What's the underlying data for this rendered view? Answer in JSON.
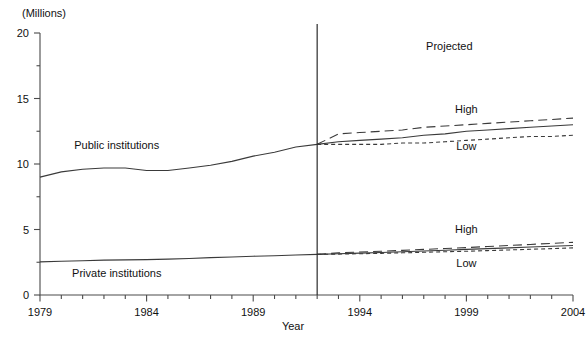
{
  "chart_data": {
    "type": "line",
    "title": "",
    "subtitle": "",
    "unit_label": "(Millions)",
    "xlabel": "Year",
    "ylabel": "",
    "xlim": [
      1979,
      2004
    ],
    "ylim": [
      0,
      20
    ],
    "yticks": [
      0,
      5,
      10,
      15,
      20
    ],
    "ytick_labels": [
      "0",
      "5",
      "10",
      "15",
      "20"
    ],
    "yminor_step": 2.5,
    "xticks": [
      1979,
      1984,
      1989,
      1994,
      1999,
      2004
    ],
    "xtick_labels": [
      "1979",
      "1984",
      "1989",
      "1994",
      "1999",
      "2004"
    ],
    "xminor_step": 1,
    "grid": false,
    "legend": "none",
    "projection_divider_year": 1992,
    "annotations": [
      {
        "name": "projected-label",
        "text": "Projected",
        "x": 1998.2,
        "y": 18.9
      },
      {
        "name": "public-series-label",
        "text": "Public institutions",
        "x": 1982.6,
        "y": 11.4
      },
      {
        "name": "private-series-label",
        "text": "Private institutions",
        "x": 1982.6,
        "y": 1.6
      },
      {
        "name": "public-high-label",
        "text": "High",
        "x": 1999.0,
        "y": 14.1
      },
      {
        "name": "public-low-label",
        "text": "Low",
        "x": 1999.0,
        "y": 11.3
      },
      {
        "name": "private-high-label",
        "text": "High",
        "x": 1999.0,
        "y": 5.0
      },
      {
        "name": "private-low-label",
        "text": "Low",
        "x": 1999.0,
        "y": 2.4
      }
    ],
    "series": [
      {
        "name": "Public institutions (actual)",
        "style": "solid",
        "x": [
          1979,
          1980,
          1981,
          1982,
          1983,
          1984,
          1985,
          1986,
          1987,
          1988,
          1989,
          1990,
          1991,
          1992
        ],
        "values": [
          9.0,
          9.4,
          9.6,
          9.7,
          9.7,
          9.5,
          9.5,
          9.7,
          9.9,
          10.2,
          10.6,
          10.9,
          11.3,
          11.5
        ]
      },
      {
        "name": "Public institutions (middle projection)",
        "style": "solid",
        "x": [
          1992,
          1993,
          1994,
          1995,
          1996,
          1997,
          1998,
          1999,
          2000,
          2001,
          2002,
          2003,
          2004
        ],
        "values": [
          11.5,
          11.7,
          11.8,
          11.9,
          12.0,
          12.2,
          12.3,
          12.5,
          12.6,
          12.7,
          12.8,
          12.9,
          13.0
        ]
      },
      {
        "name": "Public institutions (high projection)",
        "style": "long-dash",
        "x": [
          1992,
          1993,
          1994,
          1995,
          1996,
          1997,
          1998,
          1999,
          2000,
          2001,
          2002,
          2003,
          2004
        ],
        "values": [
          11.5,
          12.3,
          12.4,
          12.5,
          12.6,
          12.8,
          12.9,
          13.0,
          13.1,
          13.2,
          13.3,
          13.4,
          13.5
        ]
      },
      {
        "name": "Public institutions (low projection)",
        "style": "short-dash",
        "x": [
          1992,
          1993,
          1994,
          1995,
          1996,
          1997,
          1998,
          1999,
          2000,
          2001,
          2002,
          2003,
          2004
        ],
        "values": [
          11.5,
          11.5,
          11.5,
          11.5,
          11.6,
          11.6,
          11.7,
          11.8,
          11.9,
          12.0,
          12.1,
          12.1,
          12.2
        ]
      },
      {
        "name": "Private institutions (actual)",
        "style": "solid",
        "x": [
          1979,
          1980,
          1981,
          1982,
          1983,
          1984,
          1985,
          1986,
          1987,
          1988,
          1989,
          1990,
          1991,
          1992
        ],
        "values": [
          2.53,
          2.58,
          2.62,
          2.66,
          2.68,
          2.7,
          2.74,
          2.79,
          2.85,
          2.9,
          2.96,
          3.0,
          3.05,
          3.1
        ]
      },
      {
        "name": "Private institutions (middle projection)",
        "style": "solid",
        "x": [
          1992,
          1993,
          1994,
          1995,
          1996,
          1997,
          1998,
          1999,
          2000,
          2001,
          2002,
          2003,
          2004
        ],
        "values": [
          3.1,
          3.15,
          3.2,
          3.25,
          3.3,
          3.36,
          3.42,
          3.48,
          3.54,
          3.6,
          3.66,
          3.72,
          3.78
        ]
      },
      {
        "name": "Private institutions (high projection)",
        "style": "long-dash",
        "x": [
          1992,
          1993,
          1994,
          1995,
          1996,
          1997,
          1998,
          1999,
          2000,
          2001,
          2002,
          2003,
          2004
        ],
        "values": [
          3.1,
          3.22,
          3.28,
          3.34,
          3.41,
          3.48,
          3.55,
          3.62,
          3.7,
          3.78,
          3.86,
          3.94,
          4.02
        ]
      },
      {
        "name": "Private institutions (low projection)",
        "style": "short-dash",
        "x": [
          1992,
          1993,
          1994,
          1995,
          1996,
          1997,
          1998,
          1999,
          2000,
          2001,
          2002,
          2003,
          2004
        ],
        "values": [
          3.1,
          3.12,
          3.15,
          3.18,
          3.22,
          3.26,
          3.3,
          3.34,
          3.39,
          3.44,
          3.49,
          3.54,
          3.6
        ]
      }
    ]
  }
}
